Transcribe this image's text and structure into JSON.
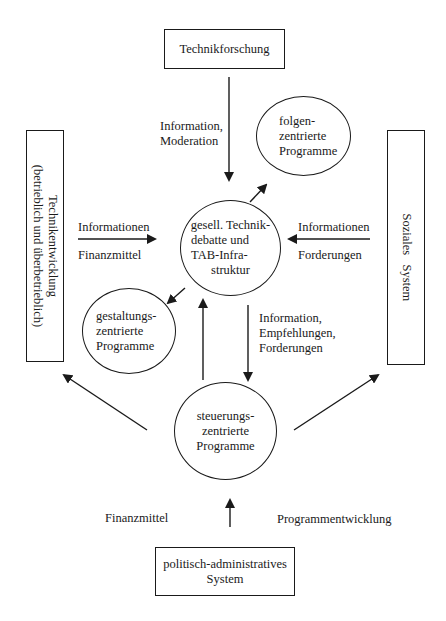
{
  "boxes": {
    "technikforschung": "Technikforschung",
    "technikentwicklung": {
      "line1": "Technikentwicklung",
      "line2": "(betrieblich und überbetrieblich)"
    },
    "soziales_system": "Soziales   System",
    "politisch_administrativ": {
      "line1": "politisch-administratives",
      "line2": "System"
    }
  },
  "circles": {
    "folgenzentriert": [
      "folgen-",
      "zentrierte",
      "Programme"
    ],
    "zentrum": [
      "gesell. Technik-",
      "debatte und",
      "TAB-Infra-",
      "struktur"
    ],
    "gestaltungszentriert": [
      "gestaltungs-",
      "zentrierte",
      "Programme"
    ],
    "steuerungszentriert": [
      "steuerungs-",
      "zentrierte",
      "Programme"
    ]
  },
  "edge_labels": {
    "from_technikforschung": [
      "Information,",
      "Moderation"
    ],
    "left_above": "Informationen",
    "left_below": "Finanzmittel",
    "right_above": "Informationen",
    "right_below": "Forderungen",
    "down_to_steuerung": [
      "Information,",
      "Empfehlungen,",
      "Forderungen"
    ],
    "bottom_left": "Finanzmittel",
    "bottom_right": "Programmentwicklung"
  },
  "colors": {
    "stroke": "#1a1a1a",
    "background": "#ffffff"
  }
}
